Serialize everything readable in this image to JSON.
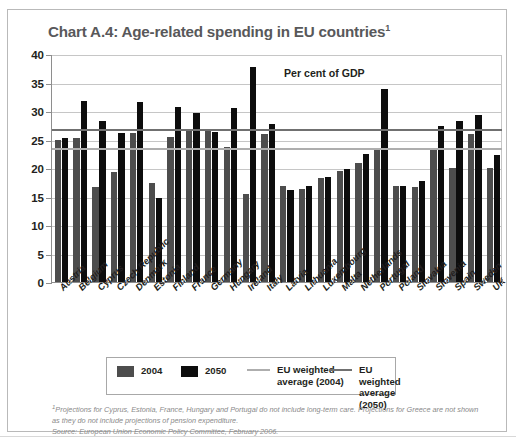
{
  "figure": {
    "title": "Chart A.4: Age-related spending in EU countries",
    "title_footnote_marker": "1",
    "axis_note": "Per cent of GDP"
  },
  "yaxis": {
    "ticks": [
      "40",
      "35",
      "30",
      "25",
      "20",
      "15",
      "10",
      "5",
      "0"
    ],
    "min": 0,
    "max": 40
  },
  "legend": {
    "series_2004_label": "2004",
    "series_2050_label": "2050",
    "avg_2004_label": "EU weighted\naverage  (2004)",
    "avg_2050_label": "EU weighted\naverage (2050)",
    "color_2004": "#4d4d4d",
    "color_2050": "#0d0d0d",
    "color_avg_2004": "#aeaeae",
    "color_avg_2050": "#707070"
  },
  "footnote": {
    "marker": "1",
    "text": "Projections for Cyprus, Estonia, France, Hungary and Portugal do not include long-term care. Projections for Greece are not shown as they do not include projections of pension expenditure.",
    "source": "Source: European Union Economic Policy Committee, February 2006."
  },
  "chart_data": {
    "type": "bar",
    "title": "Chart A.4: Age-related spending in EU countries",
    "xlabel": "",
    "ylabel": "Per cent of GDP",
    "ylim": [
      0,
      40
    ],
    "ytick_step": 5,
    "grid": true,
    "legend_position": "bottom",
    "categories": [
      "Austria",
      "Belgium",
      "Cyprus",
      "Czech Republic",
      "Denmark",
      "Estonia",
      "Finland",
      "France",
      "Germany",
      "Hungary",
      "Ireland",
      "Italy",
      "Latvia",
      "Lithuania",
      "Luxembourg",
      "Malta",
      "Netherlands",
      "Portugal",
      "Poland",
      "Slovakia",
      "Slovenia",
      "Spain",
      "Sweden",
      "UK"
    ],
    "series": [
      {
        "name": "2004",
        "color": "#4d4d4d",
        "values": [
          25.0,
          25.3,
          16.6,
          19.3,
          26.2,
          17.3,
          25.4,
          26.6,
          26.6,
          23.6,
          15.5,
          26.0,
          16.8,
          16.3,
          18.2,
          19.5,
          20.8,
          23.4,
          16.8,
          16.6,
          23.2,
          20.0,
          26.0,
          20.0
        ],
        "annotation": "Dark grey bars, left of each pair"
      },
      {
        "name": "2050",
        "color": "#0d0d0d",
        "values": [
          25.3,
          31.7,
          28.2,
          26.2,
          31.6,
          14.7,
          30.7,
          29.6,
          26.3,
          30.6,
          37.7,
          27.7,
          16.1,
          16.8,
          18.5,
          19.9,
          22.4,
          33.9,
          16.9,
          17.8,
          27.3,
          28.2,
          29.3,
          22.3
        ],
        "annotation": "Black bars, right of each pair"
      }
    ],
    "reference_lines": [
      {
        "name": "EU weighted average (2004)",
        "value": 23.5,
        "color": "#aeaeae"
      },
      {
        "name": "EU weighted average (2050)",
        "value": 26.8,
        "color": "#707070"
      }
    ]
  }
}
